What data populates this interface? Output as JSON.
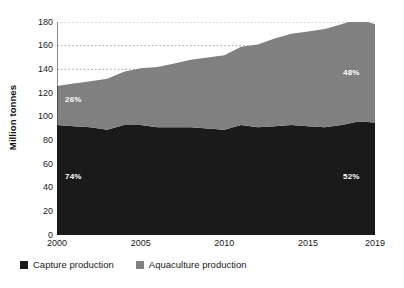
{
  "chart_data": {
    "type": "area",
    "stacked": true,
    "title": "",
    "subtitle": "",
    "xlabel": "",
    "ylabel": "Million tonnes",
    "xlim": [
      2000,
      2019
    ],
    "ylim": [
      0,
      180
    ],
    "grid": "horizontal-dotted",
    "legend_position": "bottom-left",
    "x": [
      2000,
      2001,
      2002,
      2003,
      2004,
      2005,
      2006,
      2007,
      2008,
      2009,
      2010,
      2011,
      2012,
      2013,
      2014,
      2015,
      2016,
      2017,
      2018,
      2019
    ],
    "x_tick_labels": [
      "2000",
      "2005",
      "2010",
      "2015",
      "2019"
    ],
    "x_tick_values": [
      2000,
      2005,
      2010,
      2015,
      2019
    ],
    "y_tick_labels": [
      "0",
      "20",
      "40",
      "60",
      "80",
      "100",
      "120",
      "140",
      "160",
      "180"
    ],
    "y_tick_values": [
      0,
      20,
      40,
      60,
      80,
      100,
      120,
      140,
      160,
      180
    ],
    "series": [
      {
        "name": "Capture production",
        "color": "#1a1a1a",
        "values": [
          93,
          92,
          91,
          89,
          93,
          93,
          91,
          91,
          91,
          90,
          89,
          93,
          91,
          92,
          93,
          92,
          91,
          93,
          96,
          95
        ]
      },
      {
        "name": "Aquaculture production",
        "color": "#808080",
        "values": [
          33,
          36,
          39,
          43,
          45,
          48,
          51,
          54,
          57,
          60,
          63,
          66,
          70,
          74,
          77,
          80,
          83,
          85,
          87,
          83
        ]
      }
    ],
    "annotations": [
      {
        "text": "26%",
        "series": "Aquaculture production",
        "year": 2000,
        "position": "upper-left"
      },
      {
        "text": "74%",
        "series": "Capture production",
        "year": 2000,
        "position": "lower-left"
      },
      {
        "text": "48%",
        "series": "Aquaculture production",
        "year": 2019,
        "position": "upper-right"
      },
      {
        "text": "52%",
        "series": "Capture production",
        "year": 2019,
        "position": "lower-right"
      }
    ]
  },
  "legend": {
    "items": [
      {
        "label": "Capture production",
        "color": "#1a1a1a"
      },
      {
        "label": "Aquaculture production",
        "color": "#808080"
      }
    ]
  },
  "axes": {
    "y_title": "Million tonnes"
  },
  "colors": {
    "capture": "#1a1a1a",
    "aquaculture": "#808080",
    "background": "#ffffff",
    "axis": "#1a1a1a",
    "gridline": "#9a9a9a"
  }
}
